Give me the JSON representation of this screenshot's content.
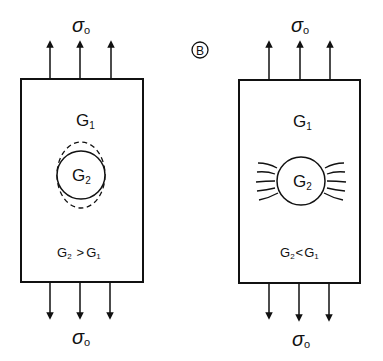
{
  "figure_label": "B",
  "stress_symbol": "σ",
  "stress_subscript": "o",
  "panels": [
    {
      "id": "left",
      "matrix_label": "G",
      "matrix_sub": "1",
      "inclusion_label": "G",
      "inclusion_sub": "2",
      "condition": {
        "lhs": "G",
        "lhs_sub": "2",
        "op": ">",
        "rhs": "G",
        "rhs_sub": "1"
      },
      "inclusion_style": "dashed-elongated-outline"
    },
    {
      "id": "right",
      "matrix_label": "G",
      "matrix_sub": "1",
      "inclusion_label": "G",
      "inclusion_sub": "2",
      "condition": {
        "lhs": "G",
        "lhs_sub": "2",
        "op": "<",
        "rhs": "G",
        "rhs_sub": "1"
      },
      "inclusion_style": "flow-lines-around"
    }
  ]
}
